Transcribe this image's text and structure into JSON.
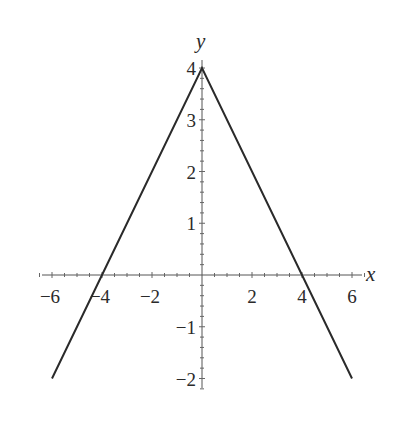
{
  "chart_data": {
    "type": "line",
    "title": "",
    "function": "y = 4 - |x|",
    "xlabel": "x",
    "ylabel": "y",
    "xlim": [
      -6,
      6
    ],
    "ylim": [
      -2,
      4
    ],
    "grid": false,
    "legend": null,
    "x_ticks": [
      -6,
      -4,
      -2,
      2,
      4,
      6
    ],
    "x_tick_labels": [
      "−6",
      "−4",
      "−2",
      "2",
      "4",
      "6"
    ],
    "y_ticks": [
      4,
      3,
      2,
      1,
      -1,
      -2
    ],
    "y_tick_labels": [
      "4",
      "3",
      "2",
      "1",
      "−1",
      "−2"
    ],
    "series": [
      {
        "name": "y = 4 - |x|",
        "x": [
          -6,
          -4,
          0,
          4,
          6
        ],
        "y": [
          -2,
          0,
          4,
          0,
          -2
        ]
      }
    ],
    "line_color": "#2a2a2a"
  }
}
